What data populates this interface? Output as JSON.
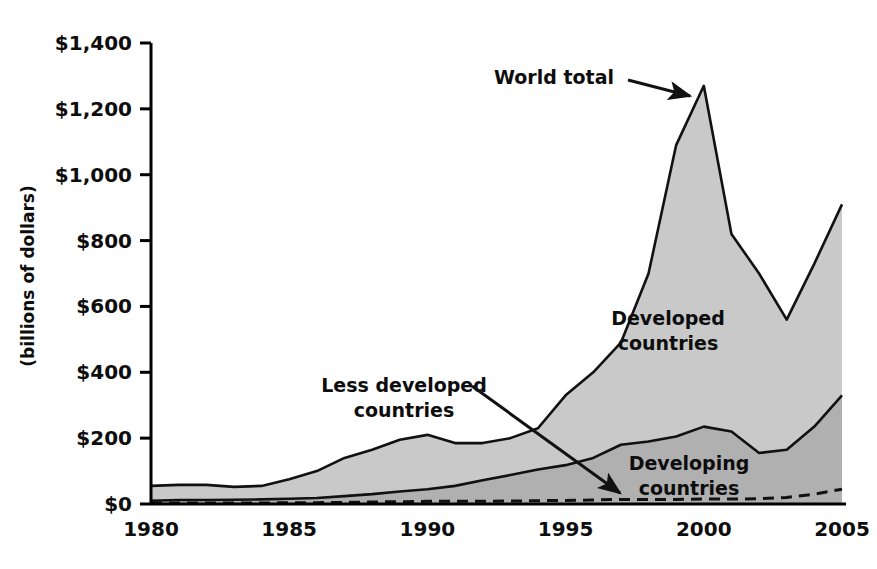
{
  "chart_data": {
    "type": "area",
    "title": "",
    "subtitle": "",
    "xlabel": "",
    "ylabel": "(billions of dollars)",
    "xlim": [
      1980,
      2005
    ],
    "ylim": [
      0,
      1400
    ],
    "grid": false,
    "legend_position": "none",
    "x_tick_labels": [
      "1980",
      "1985",
      "1990",
      "1995",
      "2000",
      "2005"
    ],
    "x_ticks": [
      1980,
      1985,
      1990,
      1995,
      2000,
      2005
    ],
    "y_tick_labels": [
      "$0",
      "$200",
      "$400",
      "$600",
      "$800",
      "$1,000",
      "$1,200",
      "$1,400"
    ],
    "y_ticks": [
      0,
      200,
      400,
      600,
      800,
      1000,
      1200,
      1400
    ],
    "x": [
      1980,
      1981,
      1982,
      1983,
      1984,
      1985,
      1986,
      1987,
      1988,
      1989,
      1990,
      1991,
      1992,
      1993,
      1994,
      1995,
      1996,
      1997,
      1998,
      1999,
      2000,
      2001,
      2002,
      2003,
      2004,
      2005
    ],
    "series": [
      {
        "name": "World total",
        "style": "solid-line-with-light-gray-fill",
        "values": [
          55,
          58,
          58,
          52,
          55,
          75,
          100,
          140,
          165,
          195,
          210,
          185,
          185,
          200,
          230,
          330,
          400,
          490,
          700,
          1090,
          1270,
          820,
          700,
          560,
          730,
          910
        ]
      },
      {
        "name": "Developing countries",
        "style": "solid-line-with-dark-gray-fill",
        "values": [
          10,
          12,
          12,
          13,
          14,
          16,
          18,
          24,
          30,
          38,
          45,
          55,
          72,
          88,
          105,
          118,
          140,
          180,
          190,
          205,
          235,
          220,
          155,
          165,
          235,
          330
        ]
      },
      {
        "name": "Less developed countries",
        "style": "dashed-line",
        "values": [
          3,
          3,
          3,
          3,
          3,
          4,
          4,
          5,
          6,
          7,
          8,
          8,
          8,
          9,
          10,
          11,
          12,
          14,
          14,
          14,
          15,
          15,
          16,
          20,
          30,
          45
        ]
      }
    ],
    "annotations": [
      {
        "id": "world-total",
        "text": "World total",
        "lines": [
          "World total"
        ],
        "label_x": 614,
        "label_y": 84,
        "anchor": "end",
        "arrow_from": [
          628,
          80
        ],
        "arrow_to": [
          690,
          96
        ]
      },
      {
        "id": "developed-countries",
        "text": "Developed countries",
        "lines": [
          "Developed",
          "countries"
        ],
        "label_x": 668,
        "label_y": 325,
        "anchor": "middle",
        "arrow_from": null,
        "arrow_to": null
      },
      {
        "id": "less-developed-countries",
        "text": "Less developed countries",
        "lines": [
          "Less developed",
          "countries"
        ],
        "label_x": 404,
        "label_y": 392,
        "anchor": "middle",
        "arrow_from": [
          472,
          386
        ],
        "arrow_to": [
          620,
          493
        ]
      },
      {
        "id": "developing-countries",
        "text": "Developing countries",
        "lines": [
          "Developing",
          "countries"
        ],
        "label_x": 689,
        "label_y": 470,
        "anchor": "middle",
        "arrow_from": null,
        "arrow_to": null
      }
    ],
    "colors": {
      "world_total_fill": "#c9c9c9",
      "developing_fill": "#b0b0b0",
      "line": "#111111",
      "axis": "#000000",
      "background": "#ffffff",
      "text": "#0d0d0d"
    }
  }
}
